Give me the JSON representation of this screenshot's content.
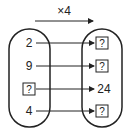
{
  "diagram": {
    "operation_label": "×4",
    "input_set": [
      "2",
      "9",
      "?",
      "4"
    ],
    "output_set": [
      "?",
      "?",
      "24",
      "?"
    ],
    "mappings": [
      {
        "from": "2",
        "to": "?"
      },
      {
        "from": "9",
        "to": "?"
      },
      {
        "from": "?",
        "to": "24"
      },
      {
        "from": "4",
        "to": "?"
      }
    ],
    "colors": {
      "stroke": "#222222",
      "background": "#ffffff"
    }
  }
}
